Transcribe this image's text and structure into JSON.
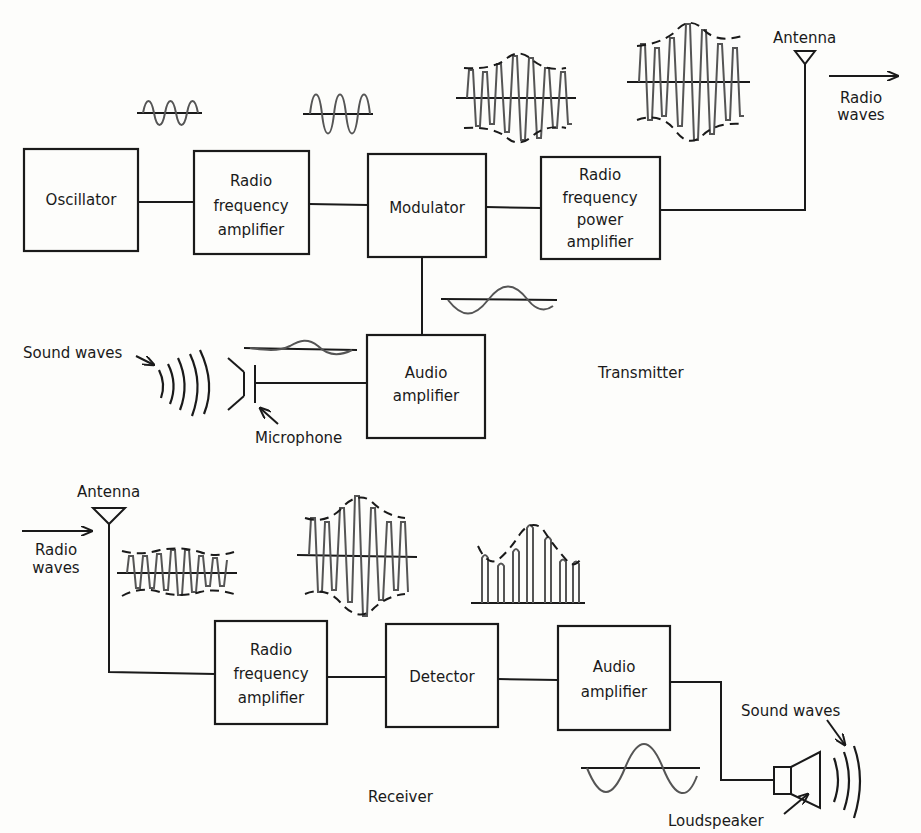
{
  "transmitter": {
    "section_label": "Transmitter",
    "blocks": {
      "oscillator": [
        "Oscillator"
      ],
      "rf_amplifier": [
        "Radio",
        "frequency",
        "amplifier"
      ],
      "modulator": [
        "Modulator"
      ],
      "rf_power_amplifier": [
        "Radio",
        "frequency",
        "power",
        "amplifier"
      ],
      "audio_amplifier": [
        "Audio",
        "amplifier"
      ]
    },
    "antenna_label": "Antenna",
    "radio_waves_label": [
      "Radio",
      "waves"
    ],
    "sound_waves_label": "Sound waves",
    "microphone_label": "Microphone"
  },
  "receiver": {
    "section_label": "Receiver",
    "blocks": {
      "rf_amplifier": [
        "Radio",
        "frequency",
        "amplifier"
      ],
      "detector": [
        "Detector"
      ],
      "audio_amplifier": [
        "Audio",
        "amplifier"
      ]
    },
    "antenna_label": "Antenna",
    "radio_waves_label": [
      "Radio",
      "waves"
    ],
    "sound_waves_label": "Sound waves",
    "loudspeaker_label": "Loudspeaker"
  },
  "colors": {
    "line": "#1a1a1a",
    "waveform": "#555555",
    "background": "#fdfdfb"
  }
}
